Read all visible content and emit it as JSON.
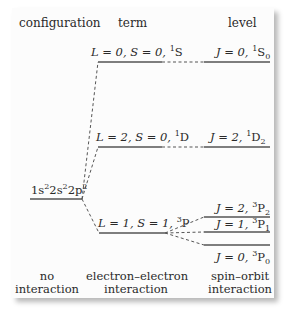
{
  "headers": {
    "configuration": "configuration",
    "term": "term",
    "level": "level"
  },
  "configuration": {
    "label_parts": [
      "1s",
      "2",
      "2s",
      "2",
      "2p",
      "2"
    ]
  },
  "terms": [
    {
      "L": "L = 0,",
      "S": "S = 0,",
      "mult": "1",
      "symbol": "S"
    },
    {
      "L": "L = 2,",
      "S": "S = 0,",
      "mult": "1",
      "symbol": "D"
    },
    {
      "L": "L = 1,",
      "S": "S = 1,",
      "mult": "3",
      "symbol": "P"
    }
  ],
  "levels": [
    {
      "J": "J = 0,",
      "mult": "1",
      "symbol": "S",
      "sub": "0"
    },
    {
      "J": "J = 2,",
      "mult": "1",
      "symbol": "D",
      "sub": "2"
    },
    {
      "J": "J = 2,",
      "mult": "3",
      "symbol": "P",
      "sub": "2"
    },
    {
      "J": "J = 1,",
      "mult": "3",
      "symbol": "P",
      "sub": "1"
    },
    {
      "J": "J = 0,",
      "mult": "3",
      "symbol": "P",
      "sub": "0"
    }
  ],
  "footer": {
    "col1_line1": "no",
    "col1_line2": "interaction",
    "col2_line1": "electron–electron",
    "col2_line2": "interaction",
    "col3_line1": "spin–orbit",
    "col3_line2": "interaction"
  },
  "colors": {
    "line": "#555555",
    "text": "#2a2a2a"
  }
}
